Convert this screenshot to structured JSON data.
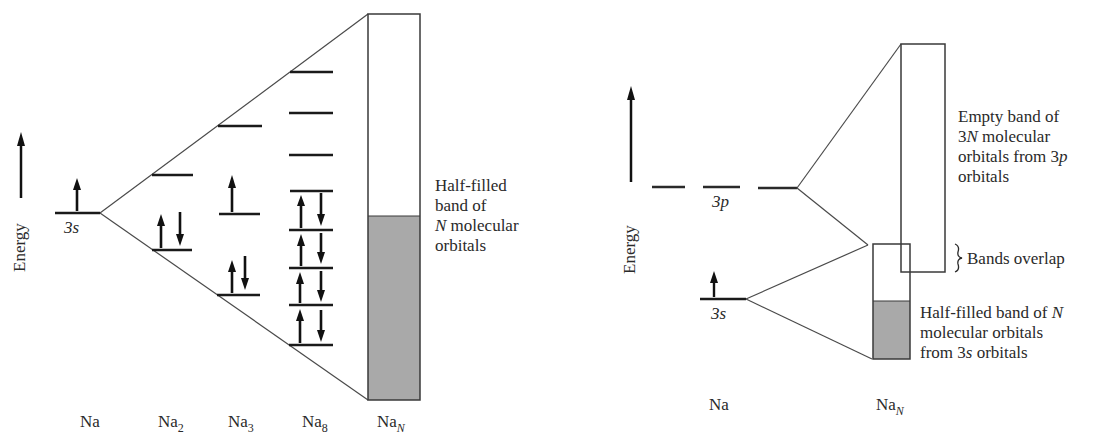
{
  "left_diagram": {
    "axis_label": "Energy",
    "orbital_label": "3s",
    "species_labels": [
      {
        "base": "Na",
        "sub": ""
      },
      {
        "base": "Na",
        "sub": "2"
      },
      {
        "base": "Na",
        "sub": "3"
      },
      {
        "base": "Na",
        "sub": "8"
      },
      {
        "base": "Na",
        "sub": "N"
      }
    ],
    "annotation": [
      "Half-filled",
      "band of",
      "N molecular",
      "orbitals"
    ],
    "levels": {
      "Na": [
        {
          "y": 213,
          "x1": 55,
          "x2": 100,
          "electrons": "up"
        }
      ],
      "Na2": [
        {
          "y": 175,
          "x1": 152,
          "x2": 193,
          "electrons": ""
        },
        {
          "y": 250,
          "x1": 152,
          "x2": 192,
          "electrons": "pair"
        }
      ],
      "Na3": [
        {
          "y": 126,
          "x1": 218,
          "x2": 262,
          "electrons": ""
        },
        {
          "y": 214,
          "x1": 219,
          "x2": 260,
          "electrons": "up"
        },
        {
          "y": 295,
          "x1": 217,
          "x2": 260,
          "electrons": "pair"
        }
      ],
      "Na8": [
        {
          "y": 72,
          "x1": 290,
          "x2": 333,
          "electrons": ""
        },
        {
          "y": 113,
          "x1": 289,
          "x2": 333,
          "electrons": ""
        },
        {
          "y": 155,
          "x1": 289,
          "x2": 333,
          "electrons": ""
        },
        {
          "y": 191,
          "x1": 290,
          "x2": 333,
          "electrons": ""
        },
        {
          "y": 230,
          "x1": 289,
          "x2": 333,
          "electrons": "pair"
        },
        {
          "y": 268,
          "x1": 289,
          "x2": 333,
          "electrons": "pair"
        },
        {
          "y": 305,
          "x1": 289,
          "x2": 333,
          "electrons": "pair"
        },
        {
          "y": 345,
          "x1": 289,
          "x2": 333,
          "electrons": "pair"
        }
      ]
    },
    "band": {
      "x": 368,
      "y_top": 14,
      "y_bottom": 400,
      "width": 52,
      "fill_from_y": 216,
      "fill_color": "#a9a9a9"
    }
  },
  "right_diagram": {
    "axis_label": "Energy",
    "orbital_labels": {
      "p": "3p",
      "s": "3s"
    },
    "species_labels": [
      {
        "base": "Na",
        "sub": ""
      },
      {
        "base": "Na",
        "sub": "N"
      }
    ],
    "annotations": {
      "empty_band": [
        "Empty band of",
        "3N molecular",
        "orbitals from 3p",
        "orbitals"
      ],
      "overlap": "Bands overlap",
      "half_filled": [
        "Half-filled band of N",
        "molecular orbitals",
        "from 3s orbitals"
      ]
    },
    "p_band": {
      "x": 901,
      "y_top": 44,
      "y_bottom": 272,
      "width": 44
    },
    "s_band": {
      "x": 873,
      "y_top": 244,
      "y_bottom": 359,
      "width": 37,
      "fill_from_y": 301,
      "fill_color": "#a9a9a9"
    }
  },
  "colors": {
    "line": "#3a3a3a",
    "thick": "#1a1a1a",
    "shade": "#a9a9a9"
  }
}
